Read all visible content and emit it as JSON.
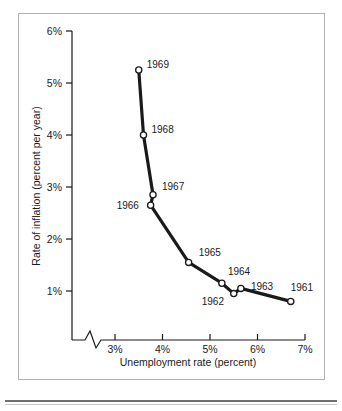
{
  "chart_data": {
    "type": "line",
    "title": "",
    "subtitle": "",
    "xlabel": "Unemployment rate (percent)",
    "ylabel": "Rate of inflation (percent per year)",
    "xlim": [
      2.55,
      7.0
    ],
    "ylim": [
      0.45,
      6.0
    ],
    "xticks": [
      "3%",
      "4%",
      "5%",
      "6%",
      "7%"
    ],
    "xtick_values": [
      3,
      4,
      5,
      6,
      7
    ],
    "yticks": [
      "1%",
      "2%",
      "3%",
      "4%",
      "5%",
      "6%"
    ],
    "ytick_values": [
      1,
      2,
      3,
      4,
      5,
      6
    ],
    "grid": false,
    "legend": null,
    "axis_break": {
      "axis": "x",
      "symbol": "zigzag",
      "position_percent": 2.75
    },
    "series": [
      {
        "name": "Phillips curve 1961-1969",
        "points": [
          {
            "label": "1969",
            "x": 3.5,
            "y": 5.25
          },
          {
            "label": "1968",
            "x": 3.6,
            "y": 4.0
          },
          {
            "label": "1967",
            "x": 3.8,
            "y": 2.85
          },
          {
            "label": "1966",
            "x": 3.75,
            "y": 2.65
          },
          {
            "label": "1965",
            "x": 4.55,
            "y": 1.55
          },
          {
            "label": "1964",
            "x": 5.25,
            "y": 1.15
          },
          {
            "label": "1962",
            "x": 5.5,
            "y": 0.95
          },
          {
            "label": "1963",
            "x": 5.65,
            "y": 1.05
          },
          {
            "label": "1961",
            "x": 6.7,
            "y": 0.8
          }
        ],
        "line_order": [
          "1969",
          "1968",
          "1967",
          "1966",
          "1965",
          "1964",
          "1962",
          "1963",
          "1961"
        ]
      }
    ],
    "point_label_offsets": [
      {
        "label": "1969",
        "dx": 8,
        "dy": -2
      },
      {
        "label": "1968",
        "dx": 8,
        "dy": -2
      },
      {
        "label": "1967",
        "dx": 9,
        "dy": -5
      },
      {
        "label": "1966",
        "dx": -34,
        "dy": 4
      },
      {
        "label": "1965",
        "dx": 10,
        "dy": -6
      },
      {
        "label": "1964",
        "dx": 6,
        "dy": -8
      },
      {
        "label": "1962",
        "dx": -32,
        "dy": 11
      },
      {
        "label": "1963",
        "dx": 10,
        "dy": 2
      },
      {
        "label": "1961",
        "dx": 0,
        "dy": -10
      }
    ],
    "colors": {
      "line": "#1a1a1a",
      "marker_fill": "#ffffff",
      "axis": "#1a1a1a",
      "background": "#ffffff",
      "frame_border": "#b0b2b4"
    }
  }
}
